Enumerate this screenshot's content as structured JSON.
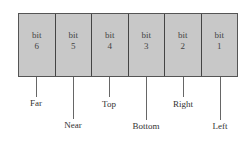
{
  "diagram": {
    "cells": [
      {
        "word": "bit",
        "num": "6",
        "label": "Far"
      },
      {
        "word": "bit",
        "num": "5",
        "label": "Near"
      },
      {
        "word": "bit",
        "num": "4",
        "label": "Top"
      },
      {
        "word": "bit",
        "num": "3",
        "label": "Bottom"
      },
      {
        "word": "bit",
        "num": "2",
        "label": "Right"
      },
      {
        "word": "bit",
        "num": "1",
        "label": "Left"
      }
    ],
    "colors": {
      "fill": "#c8c8c8",
      "border": "#444444"
    }
  }
}
